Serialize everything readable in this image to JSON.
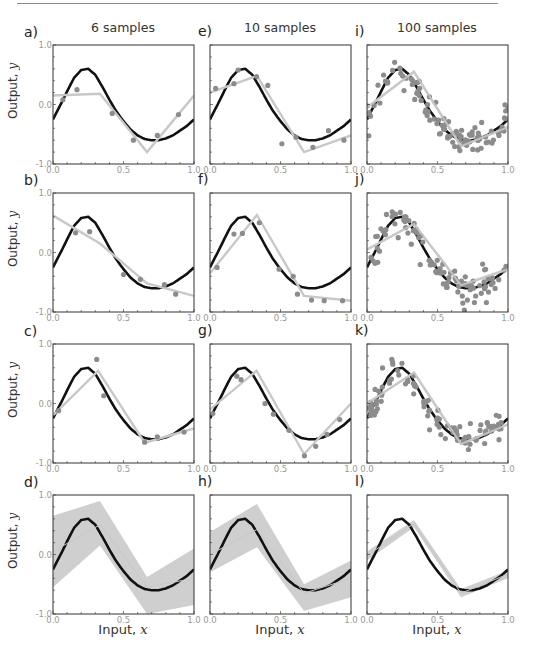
{
  "columns": [
    {
      "title": "6 samples",
      "left": 53
    },
    {
      "title": "10 samples",
      "left": 210
    },
    {
      "title": "100 samples",
      "left": 367
    }
  ],
  "rows": [
    {
      "top": 45
    },
    {
      "top": 193
    },
    {
      "top": 344
    },
    {
      "top": 495
    }
  ],
  "panel_size": {
    "width": 141,
    "height": 119
  },
  "labels": {
    "ylabel_text": "Output, ",
    "ylabel_var": "y",
    "xlabel_text": "Input, ",
    "xlabel_var": "x"
  },
  "colors": {
    "true_function": "#111111",
    "model_fit": "#c8c8c8",
    "samples": "#8c8c8c",
    "uncertainty_band": "#cfcfcf",
    "axis": "#333333",
    "tick_label": "#999999"
  },
  "chart_data": {
    "type": "line",
    "xlabel": "Input, x",
    "ylabel": "Output, y",
    "xlim": [
      0.0,
      1.0
    ],
    "ylim": [
      -1.0,
      1.0
    ],
    "xticks": [
      "0.0",
      "0.5",
      "1.0"
    ],
    "yticks": [
      "-1.0",
      "0.0",
      "1.0"
    ],
    "grid": false,
    "legend": null,
    "true_function": {
      "x": [
        0.0,
        0.05,
        0.1,
        0.15,
        0.2,
        0.25,
        0.3,
        0.35,
        0.4,
        0.45,
        0.5,
        0.55,
        0.6,
        0.65,
        0.7,
        0.75,
        0.8,
        0.85,
        0.9,
        0.95,
        1.0
      ],
      "y": [
        -0.25,
        -0.02,
        0.22,
        0.45,
        0.58,
        0.6,
        0.5,
        0.3,
        0.08,
        -0.12,
        -0.28,
        -0.42,
        -0.52,
        -0.58,
        -0.6,
        -0.6,
        -0.57,
        -0.52,
        -0.44,
        -0.36,
        -0.25
      ]
    },
    "panels": [
      {
        "id": "a",
        "column": "6 samples",
        "samples_x": [
          0.07,
          0.17,
          0.42,
          0.57,
          0.74,
          0.89
        ],
        "samples_y": [
          0.08,
          0.25,
          -0.15,
          -0.6,
          -0.52,
          -0.17
        ],
        "fit_x": [
          0.0,
          0.333,
          0.667,
          1.0
        ],
        "fit_y": [
          0.15,
          0.18,
          -0.8,
          0.15
        ]
      },
      {
        "id": "b",
        "column": "6 samples",
        "samples_x": [
          0.16,
          0.26,
          0.5,
          0.62,
          0.79,
          0.87
        ],
        "samples_y": [
          0.33,
          0.35,
          -0.37,
          -0.45,
          -0.54,
          -0.7
        ],
        "fit_x": [
          0.0,
          0.333,
          0.667,
          1.0
        ],
        "fit_y": [
          0.62,
          0.15,
          -0.52,
          -0.73
        ]
      },
      {
        "id": "c",
        "column": "6 samples",
        "samples_x": [
          0.04,
          0.31,
          0.36,
          0.65,
          0.74,
          0.93
        ],
        "samples_y": [
          -0.12,
          0.74,
          0.13,
          -0.65,
          -0.56,
          -0.48
        ],
        "fit_x": [
          0.0,
          0.32,
          0.65,
          1.0
        ],
        "fit_y": [
          -0.2,
          0.55,
          -0.66,
          -0.42
        ]
      },
      {
        "id": "d",
        "column": "6 samples",
        "band": true,
        "fit_x": [
          0.0,
          0.333,
          0.667,
          1.0
        ],
        "fit_y": [
          0.05,
          0.5,
          -0.55,
          -0.4
        ],
        "band_upper": [
          0.65,
          0.9,
          -0.38,
          0.1
        ],
        "band_lower": [
          -0.55,
          0.15,
          -1.0,
          -0.85
        ]
      },
      {
        "id": "e",
        "column": "10 samples",
        "samples_x": [
          0.04,
          0.17,
          0.2,
          0.33,
          0.41,
          0.51,
          0.61,
          0.73,
          0.84,
          0.95
        ],
        "samples_y": [
          0.27,
          0.35,
          0.58,
          0.47,
          0.32,
          -0.66,
          -0.55,
          -0.72,
          -0.44,
          -0.6
        ],
        "fit_x": [
          0.0,
          0.333,
          0.667,
          1.0
        ],
        "fit_y": [
          0.2,
          0.48,
          -0.8,
          -0.52
        ]
      },
      {
        "id": "f",
        "column": "10 samples",
        "samples_x": [
          0.05,
          0.17,
          0.23,
          0.35,
          0.49,
          0.59,
          0.62,
          0.72,
          0.81,
          0.94
        ],
        "samples_y": [
          -0.25,
          0.31,
          0.32,
          0.5,
          -0.28,
          -0.4,
          -0.7,
          -0.8,
          -0.81,
          -0.81
        ],
        "fit_x": [
          0.0,
          0.333,
          0.667,
          1.0
        ],
        "fit_y": [
          -0.35,
          0.63,
          -0.73,
          -0.81
        ]
      },
      {
        "id": "g",
        "column": "10 samples",
        "samples_x": [
          0.02,
          0.19,
          0.22,
          0.39,
          0.45,
          0.56,
          0.67,
          0.75,
          0.83,
          0.92
        ],
        "samples_y": [
          -0.17,
          0.46,
          0.4,
          0.0,
          -0.18,
          -0.45,
          -0.88,
          -0.72,
          -0.52,
          -0.27
        ],
        "fit_x": [
          0.0,
          0.33,
          0.667,
          1.0
        ],
        "fit_y": [
          -0.1,
          0.55,
          -0.85,
          -0.0
        ]
      },
      {
        "id": "h",
        "column": "10 samples",
        "band": true,
        "fit_x": [
          0.0,
          0.333,
          0.667,
          1.0
        ],
        "fit_y": [
          0.0,
          0.42,
          -0.65,
          -0.4
        ],
        "band_upper": [
          0.38,
          0.85,
          -0.5,
          -0.1
        ],
        "band_lower": [
          -0.3,
          0.12,
          -0.95,
          -0.72
        ]
      },
      {
        "id": "i",
        "column": "100 samples",
        "n_samples": 100,
        "seed": 1,
        "fit_x": [
          0.0,
          0.333,
          0.667,
          1.0
        ],
        "fit_y": [
          -0.05,
          0.55,
          -0.7,
          -0.38
        ]
      },
      {
        "id": "j",
        "column": "100 samples",
        "n_samples": 100,
        "seed": 2,
        "fit_x": [
          0.0,
          0.333,
          0.667,
          1.0
        ],
        "fit_y": [
          0.05,
          0.48,
          -0.55,
          -0.28
        ]
      },
      {
        "id": "k",
        "column": "100 samples",
        "n_samples": 100,
        "seed": 3,
        "fit_x": [
          0.0,
          0.333,
          0.667,
          1.0
        ],
        "fit_y": [
          0.0,
          0.52,
          -0.68,
          -0.35
        ]
      },
      {
        "id": "l",
        "column": "100 samples",
        "band": true,
        "fit_x": [
          0.0,
          0.333,
          0.667,
          1.0
        ],
        "fit_y": [
          -0.02,
          0.52,
          -0.65,
          -0.33
        ],
        "band_upper": [
          0.05,
          0.58,
          -0.58,
          -0.27
        ],
        "band_lower": [
          -0.1,
          0.46,
          -0.72,
          -0.4
        ]
      }
    ]
  },
  "panel_letters": [
    "a)",
    "b)",
    "c)",
    "d)",
    "e)",
    "f)",
    "g)",
    "h)",
    "i)",
    "j)",
    "k)",
    "l)"
  ]
}
